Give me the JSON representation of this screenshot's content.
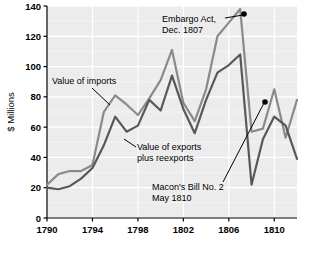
{
  "chart_data": {
    "type": "line",
    "title": "",
    "xlabel": "",
    "ylabel": "$ Millions",
    "xlim": [
      1790,
      1812
    ],
    "ylim": [
      0,
      140
    ],
    "grid": true,
    "legend_position": "inline-annotations",
    "x": [
      1790,
      1791,
      1792,
      1793,
      1794,
      1795,
      1796,
      1797,
      1798,
      1799,
      1800,
      1801,
      1802,
      1803,
      1804,
      1805,
      1806,
      1807,
      1808,
      1809,
      1810,
      1811,
      1812
    ],
    "xticks": [
      1790,
      1794,
      1798,
      1802,
      1806,
      1810
    ],
    "xticklabels": [
      "1790",
      "1794",
      "1798",
      "1802",
      "1806",
      "1810"
    ],
    "yticks": [
      0,
      20,
      40,
      60,
      80,
      100,
      120,
      140
    ],
    "yticklabels": [
      "0",
      "20",
      "40",
      "60",
      "80",
      "100",
      "120",
      "140"
    ],
    "series": [
      {
        "name": "Value of imports",
        "color": "#8a8a8a",
        "values": [
          22,
          29,
          31,
          31,
          35,
          70,
          81,
          75,
          68,
          79,
          91,
          111,
          76,
          64,
          85,
          120,
          129,
          138,
          57,
          59,
          85,
          53,
          78
        ]
      },
      {
        "name": "Value of exports plus reexports",
        "color": "#585858",
        "values": [
          20,
          19,
          21,
          26,
          33,
          48,
          67,
          57,
          61,
          78,
          71,
          94,
          72,
          56,
          78,
          96,
          101,
          108,
          22,
          52,
          67,
          61,
          39
        ]
      }
    ],
    "annotations": [
      {
        "name": "embargo-act",
        "lines": [
          "Embargo Act,",
          "Dec. 1807"
        ],
        "text_x": 162,
        "text_y": 22,
        "leader": [
          [
            225,
            18
          ],
          [
            243,
            15
          ]
        ],
        "marker": {
          "x": 244,
          "y": 14,
          "visible": true
        }
      },
      {
        "name": "value-of-imports",
        "lines": [
          "Value of imports"
        ],
        "text_x": 52,
        "text_y": 84,
        "leader": [
          [
            92,
            88
          ],
          [
            110,
            105
          ]
        ],
        "marker": {
          "visible": false
        }
      },
      {
        "name": "value-of-exports",
        "lines": [
          "Value of exports",
          "plus reexports"
        ],
        "text_x": 137,
        "text_y": 150,
        "leader": [
          [
            136,
            147
          ],
          [
            124,
            139
          ]
        ],
        "marker": {
          "visible": false
        }
      },
      {
        "name": "macons-bill",
        "lines": [
          "Macon's Bill No. 2",
          "May 1810"
        ],
        "text_x": 152,
        "text_y": 190,
        "leader": [
          [
            223,
            182
          ],
          [
            264,
            103
          ]
        ],
        "marker": {
          "x": 265,
          "y": 102,
          "visible": true
        }
      }
    ]
  },
  "figure": {
    "plot_background": "#ececec",
    "grid_color": "#ffffff",
    "axis_color": "#000000",
    "page_background": "#ffffff"
  }
}
